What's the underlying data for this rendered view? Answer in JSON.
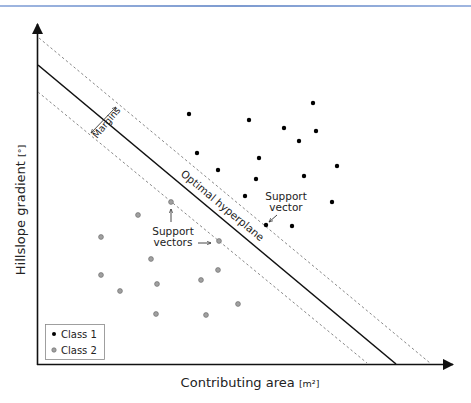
{
  "figure": {
    "header_rule_color": "#7d9bd0",
    "x_axis_label": "Contributing area",
    "x_axis_unit": "[m²]",
    "y_axis_label": "Hillslope gradient",
    "y_axis_unit": "[°]",
    "annotations": {
      "margins": "Margins",
      "hyperplane": "Optimal hyperplane",
      "support_vector_line1": "Support",
      "support_vector_line2": "vector",
      "support_vectors_line1": "Support",
      "support_vectors_line2": "vectors"
    },
    "legend": {
      "items": [
        {
          "label": "Class 1",
          "color": "#000000"
        },
        {
          "label": "Class 2",
          "color": "#999999"
        }
      ]
    },
    "colors": {
      "axis": "#111111",
      "hyperplane": "#111111",
      "margin": "#888888",
      "class1": "#000000",
      "class2_fill": "#a0a0a0",
      "class2_stroke": "#6e6e6e"
    }
  },
  "chart_data": {
    "type": "scatter",
    "title": "",
    "xlabel": "Contributing area [m²]",
    "ylabel": "Hillslope gradient [°]",
    "grid": false,
    "legend_position": "lower-left",
    "note": "Schematic SVM diagram; points given in pixel coordinates (x right, y down)",
    "series": [
      {
        "name": "Class 1",
        "points": [
          [
            189,
            114
          ],
          [
            249,
            120
          ],
          [
            313,
            103
          ],
          [
            284,
            128
          ],
          [
            316,
            131
          ],
          [
            299,
            141
          ],
          [
            197,
            153
          ],
          [
            259,
            158
          ],
          [
            337,
            166
          ],
          [
            218,
            170
          ],
          [
            256,
            179
          ],
          [
            304,
            176
          ],
          [
            245,
            196
          ],
          [
            332,
            202
          ],
          [
            266,
            225
          ],
          [
            292,
            226
          ]
        ]
      },
      {
        "name": "Class 2",
        "points": [
          [
            171,
            202
          ],
          [
            138,
            215
          ],
          [
            101,
            237
          ],
          [
            219,
            241
          ],
          [
            151,
            259
          ],
          [
            101,
            275
          ],
          [
            218,
            270
          ],
          [
            201,
            280
          ],
          [
            157,
            284
          ],
          [
            120,
            291
          ],
          [
            238,
            304
          ],
          [
            156,
            314
          ],
          [
            206,
            315
          ]
        ]
      }
    ],
    "lines": [
      {
        "name": "Optimal hyperplane",
        "from": [
          37,
          65
        ],
        "to": [
          396,
          363
        ],
        "style": "solid"
      },
      {
        "name": "Upper margin",
        "from": [
          39,
          38
        ],
        "to": [
          430,
          363
        ],
        "style": "dashed"
      },
      {
        "name": "Lower margin",
        "from": [
          37,
          92
        ],
        "to": [
          367,
          363
        ],
        "style": "dashed"
      }
    ]
  }
}
